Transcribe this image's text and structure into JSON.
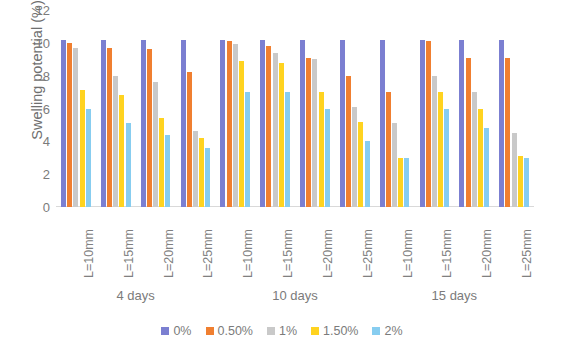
{
  "chart_data": {
    "type": "bar",
    "title": "",
    "xlabel": "",
    "ylabel": "Swelling potential (%)",
    "ylim": [
      0,
      12
    ],
    "yticks": [
      0,
      2,
      4,
      6,
      8,
      10,
      12
    ],
    "grid": false,
    "legend_position": "bottom",
    "categories": [
      "L=10mm",
      "L=15mm",
      "L=20mm",
      "L=25mm",
      "L=10mm",
      "L=15mm",
      "L=20mm",
      "L=25mm",
      "L=10mm",
      "L=15mm",
      "L=20mm",
      "L=25mm"
    ],
    "group_labels": [
      "4 days",
      "10 days",
      "15 days"
    ],
    "series": [
      {
        "name": "0%",
        "color": "#7b7fd1",
        "values": [
          10.2,
          10.2,
          10.2,
          10.2,
          10.2,
          10.2,
          10.2,
          10.2,
          10.2,
          10.2,
          10.2,
          10.2
        ]
      },
      {
        "name": "0.50%",
        "color": "#f07f30",
        "values": [
          10.0,
          9.7,
          9.6,
          8.2,
          10.1,
          9.8,
          9.1,
          8.0,
          7.0,
          10.1,
          9.1,
          9.1
        ]
      },
      {
        "name": "1%",
        "color": "#c9c9c9",
        "values": [
          9.7,
          8.0,
          7.6,
          4.6,
          9.9,
          9.4,
          9.0,
          6.1,
          5.1,
          8.0,
          7.0,
          4.5
        ]
      },
      {
        "name": "1.50%",
        "color": "#ffd320",
        "values": [
          7.1,
          6.8,
          5.4,
          4.2,
          8.9,
          8.8,
          7.0,
          5.2,
          3.0,
          7.0,
          6.0,
          3.1
        ]
      },
      {
        "name": "2%",
        "color": "#87cdf0",
        "values": [
          6.0,
          5.1,
          4.4,
          3.6,
          7.0,
          7.0,
          6.0,
          4.0,
          3.0,
          6.0,
          4.8,
          3.0
        ]
      }
    ]
  },
  "legend": {
    "items": [
      {
        "label": "0%",
        "color": "#7b7fd1"
      },
      {
        "label": "0.50%",
        "color": "#f07f30"
      },
      {
        "label": "1%",
        "color": "#c9c9c9"
      },
      {
        "label": "1.50%",
        "color": "#ffd320"
      },
      {
        "label": "2%",
        "color": "#87cdf0"
      }
    ]
  }
}
